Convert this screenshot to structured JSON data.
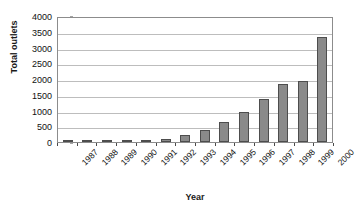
{
  "chart_data": {
    "type": "bar",
    "title": "",
    "subtitle": "",
    "xlabel": "Year",
    "ylabel": "Total outlets",
    "categories": [
      "1987",
      "1988",
      "1989",
      "1990",
      "1991",
      "1992",
      "1993",
      "1994",
      "1995",
      "1996",
      "1997",
      "1998",
      "1999",
      "2000"
    ],
    "values": [
      10,
      15,
      25,
      40,
      70,
      110,
      220,
      380,
      620,
      960,
      1350,
      1830,
      1930,
      3320
    ],
    "series": [
      {
        "name": "Total outlets",
        "values": [
          10,
          15,
          25,
          40,
          70,
          110,
          220,
          380,
          620,
          960,
          1350,
          1830,
          1930,
          3320
        ]
      }
    ],
    "ylim": [
      0,
      4000
    ],
    "ytick_labels": [
      "0",
      "500",
      "1000",
      "1500",
      "2000",
      "2500",
      "3000",
      "3500",
      "4000"
    ],
    "ytick_values": [
      0,
      500,
      1000,
      1500,
      2000,
      2500,
      3000,
      3500,
      4000
    ],
    "ytick_step": 500,
    "grid": true,
    "grid_axis": "y",
    "legend": false,
    "legend_position": "none",
    "bar_color": "#8a8a8a",
    "bar_border_color": "#4d4d4d",
    "grid_color": "#bdbdbd",
    "axis_color": "#8c8c8c",
    "plot_background": "#ffffff",
    "xtick_label_rotation": -45
  }
}
